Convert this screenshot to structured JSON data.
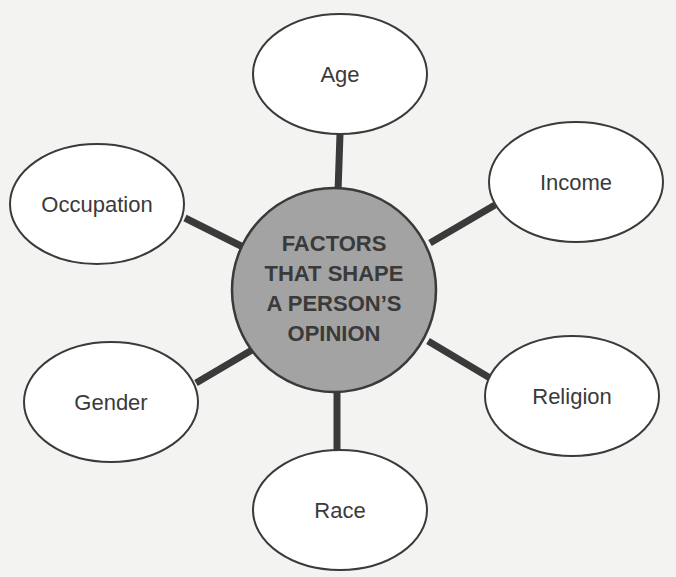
{
  "diagram": {
    "type": "mind-map",
    "center": {
      "lines": [
        "FACTORS",
        "THAT SHAPE",
        "A PERSON’S",
        "OPINION"
      ]
    },
    "nodes": [
      {
        "label": "Age"
      },
      {
        "label": "Income"
      },
      {
        "label": "Religion"
      },
      {
        "label": "Race"
      },
      {
        "label": "Gender"
      },
      {
        "label": "Occupation"
      }
    ],
    "colors": {
      "background": "#f3f3f2",
      "center_fill": "#a3a3a3",
      "stroke": "#3a3a3a",
      "node_fill": "#ffffff"
    }
  }
}
